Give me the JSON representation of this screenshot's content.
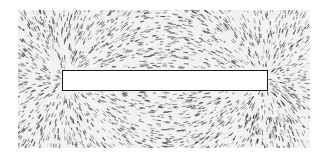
{
  "scene": {
    "subject": "iron filings around a bar magnet",
    "magnet": {
      "shape": "bar",
      "fill": "#ffffff",
      "outline": "#1a1a1a"
    },
    "filings": {
      "color": "#3a3a3a",
      "background": "#f2f2f2"
    },
    "background": "#ffffff"
  }
}
